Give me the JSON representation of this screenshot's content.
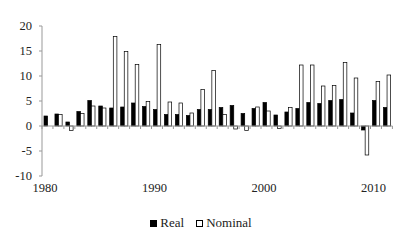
{
  "chart_data": {
    "type": "bar",
    "title": "",
    "xlabel": "",
    "ylabel": "",
    "ylim": [
      -10,
      20
    ],
    "yticks": [
      -10,
      -5,
      0,
      5,
      10,
      15,
      20
    ],
    "xtick_labels": [
      "1980",
      "1990",
      "2000",
      "2010"
    ],
    "categories": [
      "1980",
      "1981",
      "1982",
      "1983",
      "1984",
      "1985",
      "1986",
      "1987",
      "1988",
      "1989",
      "1990",
      "1991",
      "1992",
      "1993",
      "1994",
      "1995",
      "1996",
      "1997",
      "1998",
      "1999",
      "2000",
      "2001",
      "2002",
      "2003",
      "2004",
      "2005",
      "2006",
      "2007",
      "2008",
      "2009",
      "2010",
      "2011"
    ],
    "series": [
      {
        "name": "Real",
        "color": "#000000",
        "values": [
          2.0,
          2.4,
          0.8,
          2.9,
          5.1,
          4.0,
          3.6,
          3.8,
          4.6,
          3.9,
          3.3,
          2.3,
          2.3,
          2.1,
          3.3,
          3.3,
          3.7,
          4.1,
          2.5,
          3.5,
          4.7,
          2.2,
          2.8,
          3.5,
          4.7,
          4.5,
          5.1,
          5.3,
          2.6,
          -0.8,
          5.1,
          3.7
        ]
      },
      {
        "name": "Nominal",
        "color": "#ffffff",
        "values": [
          0.0,
          2.3,
          -0.9,
          2.5,
          4.0,
          3.6,
          17.9,
          14.9,
          12.3,
          4.9,
          16.3,
          4.8,
          4.6,
          2.6,
          7.3,
          11.1,
          2.3,
          -0.6,
          -0.9,
          3.8,
          3.0,
          -0.5,
          3.7,
          12.2,
          12.2,
          8.0,
          8.1,
          12.7,
          9.6,
          -5.8,
          8.9,
          10.2
        ]
      }
    ],
    "legend_position": "bottom",
    "grid": false
  },
  "legend": {
    "real_label": "Real",
    "nominal_label": "Nominal"
  }
}
